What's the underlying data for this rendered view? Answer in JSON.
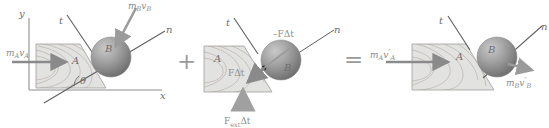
{
  "figure": {
    "background_color": "#ffffff",
    "line_color": "#6e6e6e",
    "arrow_color": "#8a8a8a",
    "block_fill": "#e2e2e0",
    "sphere_fill": "#9a9a9a"
  },
  "operators": {
    "plus": "+",
    "equals": "="
  },
  "panels": [
    {
      "id": "before",
      "name": "initial-momenta",
      "axes": [
        {
          "name": "y-axis",
          "label": "y"
        },
        {
          "name": "x-axis",
          "label": "x"
        },
        {
          "name": "t-axis",
          "label": "t"
        },
        {
          "name": "n-axis",
          "label": "n"
        },
        {
          "name": "angle-theta",
          "label": "θ"
        }
      ],
      "bodies": [
        {
          "name": "block-a",
          "label": "A"
        },
        {
          "name": "sphere-b",
          "label": "B"
        }
      ],
      "vectors": [
        {
          "name": "momentum-a-initial",
          "base": "m",
          "base_sub": "A",
          "vel": "v",
          "vel_sub": "A",
          "prime": ""
        },
        {
          "name": "momentum-b-initial",
          "base": "m",
          "base_sub": "B",
          "vel": "v",
          "vel_sub": "B",
          "prime": ""
        }
      ]
    },
    {
      "id": "impulse",
      "name": "impulses",
      "axes": [
        {
          "name": "t-axis",
          "label": "t"
        },
        {
          "name": "n-axis",
          "label": "n"
        }
      ],
      "bodies": [
        {
          "name": "block-a",
          "label": "A"
        },
        {
          "name": "sphere-b",
          "label": "B"
        }
      ],
      "impulses": [
        {
          "name": "impulse-on-a",
          "label": "FΔt"
        },
        {
          "name": "impulse-on-b",
          "label": "–FΔt"
        },
        {
          "name": "external-impulse",
          "base": "F",
          "sub": "ext",
          "tail": "Δt"
        }
      ]
    },
    {
      "id": "after",
      "name": "final-momenta",
      "axes": [
        {
          "name": "t-axis",
          "label": "t"
        },
        {
          "name": "n-axis",
          "label": "n"
        }
      ],
      "bodies": [
        {
          "name": "block-a",
          "label": "A"
        },
        {
          "name": "sphere-b",
          "label": "B"
        }
      ],
      "vectors": [
        {
          "name": "momentum-a-final",
          "base": "m",
          "base_sub": "A",
          "vel": "v",
          "vel_sub": "A",
          "prime": "′"
        },
        {
          "name": "momentum-b-final",
          "base": "m",
          "base_sub": "B",
          "vel": "v",
          "vel_sub": "B",
          "prime": "′"
        }
      ]
    }
  ]
}
